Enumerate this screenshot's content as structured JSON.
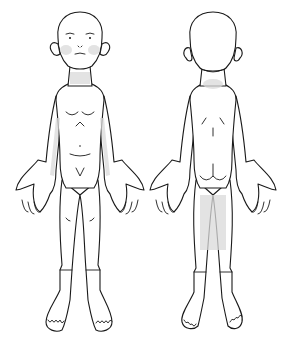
{
  "diagram": {
    "type": "body-chart",
    "views": [
      {
        "id": "front",
        "label": "",
        "x_center": 80
      },
      {
        "id": "back",
        "label": "",
        "x_center": 213
      }
    ],
    "colors": {
      "outline": "#1a1a1a",
      "shade": "#d9d9d9",
      "background": "#ffffff"
    },
    "shaded_regions": {
      "front": [
        "left-cheek",
        "right-cheek",
        "neck",
        "left-inner-arm",
        "right-inner-arm"
      ],
      "back": [
        "nape",
        "back-of-legs"
      ]
    }
  }
}
